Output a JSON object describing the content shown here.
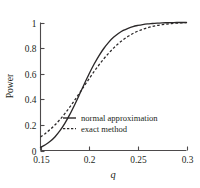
{
  "chart_data": {
    "type": "line",
    "title": "",
    "xlabel": "q",
    "ylabel": "Power",
    "xlim": [
      0.15,
      0.3
    ],
    "ylim": [
      0,
      1
    ],
    "grid": false,
    "legend_position": "inside-lower-right",
    "xticks": [
      "0.15",
      "0.2",
      "0.25",
      "0.3"
    ],
    "xtick_values": [
      0.15,
      0.2,
      0.25,
      0.3
    ],
    "yticks": [
      "0",
      "0.2",
      "0.4",
      "0.6",
      "0.8",
      "1"
    ],
    "ytick_values": [
      0,
      0.2,
      0.4,
      0.6,
      0.8,
      1
    ],
    "series": [
      {
        "name": "normal approximation",
        "style": "solid",
        "color": "#2b2829",
        "x": [
          0.15,
          0.155,
          0.16,
          0.165,
          0.17,
          0.175,
          0.18,
          0.185,
          0.19,
          0.195,
          0.2,
          0.205,
          0.21,
          0.215,
          0.22,
          0.225,
          0.23,
          0.235,
          0.24,
          0.245,
          0.25,
          0.255,
          0.26,
          0.265,
          0.27,
          0.275,
          0.28,
          0.285,
          0.29,
          0.295,
          0.3
        ],
        "values": [
          0.025,
          0.045,
          0.072,
          0.108,
          0.155,
          0.212,
          0.28,
          0.356,
          0.437,
          0.52,
          0.6,
          0.674,
          0.74,
          0.797,
          0.845,
          0.884,
          0.914,
          0.938,
          0.955,
          0.968,
          0.977,
          0.984,
          0.989,
          0.992,
          0.995,
          0.997,
          0.998,
          0.999,
          1.0,
          1.0,
          1.0
        ]
      },
      {
        "name": "exact method",
        "style": "dashed",
        "color": "#2b2829",
        "x": [
          0.15,
          0.155,
          0.16,
          0.165,
          0.17,
          0.175,
          0.18,
          0.185,
          0.19,
          0.195,
          0.2,
          0.205,
          0.21,
          0.215,
          0.22,
          0.225,
          0.23,
          0.235,
          0.24,
          0.245,
          0.25,
          0.255,
          0.26,
          0.265,
          0.27,
          0.275,
          0.28,
          0.285,
          0.29,
          0.295,
          0.3
        ],
        "values": [
          0.105,
          0.133,
          0.165,
          0.201,
          0.242,
          0.288,
          0.338,
          0.392,
          0.448,
          0.505,
          0.561,
          0.616,
          0.668,
          0.716,
          0.76,
          0.8,
          0.835,
          0.866,
          0.892,
          0.914,
          0.932,
          0.947,
          0.959,
          0.969,
          0.977,
          0.983,
          0.988,
          0.992,
          0.995,
          0.997,
          0.999
        ]
      }
    ],
    "legend": [
      {
        "label": "normal approximation",
        "style": "solid"
      },
      {
        "label": "exact method",
        "style": "dashed"
      }
    ]
  },
  "colors": {
    "axis": "#4d4a4b",
    "curve": "#2b2829",
    "background": "#ffffff",
    "text": "#231f20"
  }
}
